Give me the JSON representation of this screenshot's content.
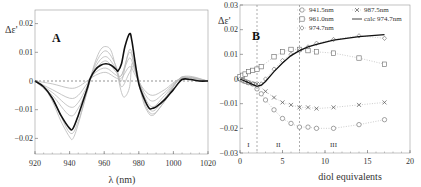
{
  "chart_data": [
    {
      "panel": "A",
      "type": "line",
      "xlabel": "λ (nm)",
      "ylabel": "Δε'",
      "xlim": [
        920,
        1020
      ],
      "ylim": [
        -0.025,
        0.025
      ],
      "xticks": [
        920,
        940,
        960,
        980,
        1000,
        1020
      ],
      "yticks": [
        0.02,
        0.01,
        0,
        -0.01,
        -0.02
      ],
      "ytick_labels": [
        "0.02",
        "0.01",
        "0",
        "−0.01",
        "−0.02"
      ],
      "zero_line": "dashed",
      "series": [
        {
          "name": "bold spectrum",
          "style": "black bold",
          "x": [
            920,
            925,
            930,
            935,
            940,
            942,
            945,
            950,
            952,
            955,
            958,
            961,
            964,
            967,
            968,
            970,
            972,
            974.7,
            976,
            978,
            980,
            983,
            986,
            988,
            990,
            995,
            1000,
            1005,
            1010,
            1015,
            1020
          ],
          "y": [
            0,
            -0.002,
            -0.006,
            -0.012,
            -0.0165,
            -0.0165,
            -0.012,
            -0.003,
            0.001,
            0.004,
            0.0055,
            0.006,
            0.0055,
            0.004,
            0.0035,
            0.006,
            0.012,
            0.0165,
            0.014,
            0.006,
            -0.001,
            -0.006,
            -0.0095,
            -0.0095,
            -0.009,
            -0.0065,
            -0.003,
            0.0005,
            0.0005,
            0,
            0
          ]
        },
        {
          "name": "grey envelope max",
          "style": "grey",
          "x": [
            920,
            925,
            930,
            935,
            940,
            942,
            945,
            950,
            952,
            955,
            958,
            961,
            964,
            967,
            970,
            972,
            974.7,
            976,
            978,
            980,
            983,
            986,
            988,
            990,
            995,
            1000,
            1005,
            1010,
            1015,
            1020
          ],
          "y": [
            0,
            -0.002,
            -0.007,
            -0.014,
            -0.0195,
            -0.02,
            -0.015,
            -0.004,
            0.001,
            0.007,
            0.011,
            0.012,
            0.0105,
            0.004,
            -0.004,
            -0.0055,
            -0.002,
            0.006,
            0.004,
            -0.001,
            -0.008,
            -0.0115,
            -0.012,
            -0.011,
            -0.007,
            -0.002,
            0.0015,
            0.0005,
            0,
            0
          ]
        },
        {
          "name": "grey intermediate 1",
          "style": "grey",
          "x": [
            920,
            930,
            940,
            945,
            950,
            955,
            961,
            967,
            970,
            974.7,
            978,
            983,
            988,
            995,
            1005,
            1020
          ],
          "y": [
            0,
            -0.001,
            -0.0025,
            -0.002,
            0,
            0.002,
            0.003,
            0.001,
            0.001,
            0.005,
            0.002,
            -0.003,
            -0.005,
            -0.003,
            0.001,
            0
          ]
        },
        {
          "name": "grey intermediate 2",
          "style": "grey",
          "x": [
            920,
            930,
            940,
            945,
            950,
            955,
            961,
            967,
            970,
            974.7,
            978,
            983,
            988,
            995,
            1005,
            1020
          ],
          "y": [
            0,
            -0.003,
            -0.006,
            -0.005,
            -0.001,
            0.003,
            0.0045,
            0.002,
            0.002,
            0.008,
            0.003,
            -0.004,
            -0.007,
            -0.004,
            0.001,
            0
          ]
        },
        {
          "name": "grey intermediate 3",
          "style": "grey",
          "x": [
            920,
            930,
            940,
            945,
            950,
            955,
            961,
            967,
            970,
            974.7,
            978,
            983,
            988,
            995,
            1005,
            1020
          ],
          "y": [
            0,
            -0.004,
            -0.009,
            -0.0075,
            -0.002,
            0.004,
            0.007,
            0.003,
            0.002,
            0.01,
            0.004,
            -0.005,
            -0.009,
            -0.005,
            0.001,
            0
          ]
        },
        {
          "name": "grey intermediate 4",
          "style": "grey",
          "x": [
            920,
            930,
            940,
            945,
            950,
            955,
            961,
            967,
            970,
            974.7,
            978,
            983,
            988,
            995,
            1005,
            1020
          ],
          "y": [
            0,
            -0.005,
            -0.012,
            -0.0095,
            -0.003,
            0.005,
            0.0085,
            0.004,
            0,
            0.011,
            0.004,
            -0.006,
            -0.0105,
            -0.006,
            0.0012,
            0
          ]
        },
        {
          "name": "grey intermediate 5",
          "style": "grey",
          "x": [
            920,
            930,
            940,
            945,
            950,
            955,
            961,
            967,
            970,
            974.7,
            978,
            983,
            988,
            995,
            1005,
            1020
          ],
          "y": [
            0,
            -0.006,
            -0.018,
            -0.014,
            -0.004,
            0.006,
            0.0105,
            0.005,
            -0.002,
            0.003,
            0.005,
            -0.007,
            -0.0115,
            -0.007,
            0.0014,
            0
          ]
        }
      ]
    },
    {
      "panel": "B",
      "type": "scatter",
      "xlabel": "diol equivalents",
      "ylabel": "Δε'",
      "xlim": [
        0,
        20
      ],
      "ylim": [
        -0.03,
        0.03
      ],
      "xticks": [
        0,
        5,
        10,
        15,
        20
      ],
      "yticks": [
        0.03,
        0.02,
        0.01,
        0,
        -0.01,
        -0.02,
        -0.03
      ],
      "ytick_labels": [
        "0.03",
        "0.02",
        "0.01",
        "0",
        "−0.01",
        "−0.02",
        "−0.03"
      ],
      "vlines": [
        2,
        7
      ],
      "region_labels": [
        {
          "x": 1,
          "label": "I"
        },
        {
          "x": 4.5,
          "label": "II"
        },
        {
          "x": 11,
          "label": "III"
        }
      ],
      "legend": [
        "941.5nm",
        "987.5nm",
        "961.0nm",
        "calc 974.7nm",
        "974.7nm"
      ],
      "series": [
        {
          "name": "941.5nm",
          "marker": "circle",
          "x": [
            0,
            0.3,
            0.6,
            1.0,
            1.5,
            2,
            2.5,
            3,
            4,
            5,
            6,
            7,
            8,
            9,
            11,
            14,
            17
          ],
          "y": [
            0,
            -0.0005,
            -0.001,
            -0.0015,
            -0.002,
            -0.004,
            -0.006,
            -0.0085,
            -0.0125,
            -0.016,
            -0.018,
            -0.0195,
            -0.0195,
            -0.02,
            -0.02,
            -0.0185,
            -0.0165
          ]
        },
        {
          "name": "987.5nm",
          "marker": "x",
          "x": [
            0,
            0.3,
            0.6,
            1.0,
            1.5,
            2,
            3,
            4,
            5,
            6,
            7,
            8,
            9,
            11,
            14,
            17
          ],
          "y": [
            0,
            -0.0005,
            -0.001,
            -0.0015,
            -0.002,
            -0.002,
            -0.005,
            -0.0075,
            -0.0095,
            -0.0105,
            -0.0115,
            -0.0115,
            -0.012,
            -0.0115,
            -0.0105,
            -0.0095
          ]
        },
        {
          "name": "961.0nm",
          "marker": "square",
          "x": [
            0,
            0.3,
            0.6,
            1.0,
            1.5,
            2,
            2.5,
            4,
            5,
            6,
            7,
            8,
            9,
            11,
            14,
            17
          ],
          "y": [
            0.001,
            0.0015,
            0.002,
            0.003,
            0.0035,
            0.004,
            0.005,
            0.009,
            0.011,
            0.012,
            0.012,
            0.0115,
            0.011,
            0.0105,
            0.0085,
            0.006
          ]
        },
        {
          "name": "974.7nm",
          "marker": "diamond",
          "x": [
            0,
            0.3,
            0.6,
            1.0,
            1.5,
            2,
            2.5,
            3,
            4,
            5,
            6,
            7,
            8,
            9,
            11,
            14,
            17
          ],
          "y": [
            0,
            -0.0005,
            -0.001,
            -0.0015,
            -0.002,
            -0.003,
            -0.002,
            0,
            0.004,
            0.0075,
            0.01,
            0.0115,
            0.013,
            0.0145,
            0.016,
            0.0175,
            0.0165
          ]
        },
        {
          "name": "calc 974.7nm",
          "marker": "none",
          "style": "solid black line",
          "x": [
            0,
            1,
            2,
            2.5,
            3,
            4,
            5,
            6,
            7,
            8,
            9,
            11,
            14,
            17
          ],
          "y": [
            0,
            -0.0015,
            -0.003,
            -0.0025,
            -0.001,
            0.003,
            0.0065,
            0.0095,
            0.0115,
            0.013,
            0.014,
            0.0158,
            0.0172,
            0.018
          ]
        }
      ]
    }
  ]
}
